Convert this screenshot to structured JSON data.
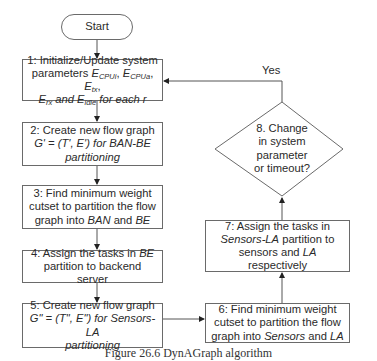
{
  "diagram": {
    "type": "flowchart",
    "start": {
      "label": "Start"
    },
    "steps": [
      {
        "id": 1,
        "lines": [
          {
            "prefix": "1: Initialize/Update system"
          },
          {
            "prefix": "parameters",
            "vars": [
              "E_CPUi",
              "E_CPUa",
              "E_tx"
            ]
          },
          {
            "vars2": [
              "E_rx",
              "E_idle"
            ],
            "suffix": "for each r"
          }
        ],
        "text": "1: Initialize/Update system parameters E_CPUi, E_CPUa, E_tx, E_rx and E_idle for each r"
      },
      {
        "id": 2,
        "text": "2: Create new flow graph G' = (T', E') for BAN-BE partitioning"
      },
      {
        "id": 3,
        "text": "3: Find minimum weight cutset to partition the flow graph into BAN and BE"
      },
      {
        "id": 4,
        "text": "4: Assign the tasks in BE partition to backend server"
      },
      {
        "id": 5,
        "text": "5: Create new flow graph G\" = (T\", E\") for Sensors-LA partitioning"
      },
      {
        "id": 6,
        "text": "6: Find minimum weight cutset to partition the flow graph into Sensors and LA"
      },
      {
        "id": 7,
        "text": "7: Assign the tasks in Sensors-LA partition to sensors and LA respectively"
      }
    ],
    "decision": {
      "id": 8,
      "text": "8. Change in system parameter or timeout?",
      "yes_label": "Yes"
    },
    "edges": [
      [
        "start",
        1
      ],
      [
        1,
        2
      ],
      [
        2,
        3
      ],
      [
        3,
        4
      ],
      [
        4,
        5
      ],
      [
        5,
        6
      ],
      [
        6,
        7
      ],
      [
        7,
        8
      ],
      [
        8,
        1,
        "Yes"
      ]
    ]
  },
  "labels": {
    "start": "Start",
    "s1_l1": "1: Initialize/Update system",
    "s1_params": "parameters",
    "E": "E",
    "sub_cpui": "CPUi",
    "sub_cpua": "CPUa",
    "sub_tx": "tx",
    "sub_rx": "rx",
    "sub_idle": "idle",
    "and": "and",
    "for_each_r": "for each r",
    "s2_l1": "2: Create new flow graph",
    "s2_l2": "G' = (T', E') for BAN-BE",
    "s2_l3": "partitioning",
    "s3_l1": "3: Find minimum weight",
    "s3_l2": "cutset to partition the flow",
    "s3_l3a": "graph into",
    "s3_ban": "BAN",
    "s3_and": "and",
    "s3_be": "BE",
    "s4_l1a": "4: Assign the tasks in",
    "s4_be": "BE",
    "s4_l2": "partition to backend server",
    "s5_l1": "5: Create new flow graph",
    "s5_l2": "G\" = (T\", E\") for Sensors-LA",
    "s5_l3": "partitioning",
    "s6_l1": "6: Find minimum weight",
    "s6_l2": "cutset to partition the flow",
    "s6_l3a": "graph into",
    "s6_sensors": "Sensors",
    "s6_and": "and",
    "s6_la": "LA",
    "s7_l1": "7: Assign the tasks in",
    "s7_sla": "Sensors-LA",
    "s7_l2b": "partition to",
    "s7_l3a": "sensors and",
    "s7_la": "LA",
    "s7_l3b": "respectively",
    "d8_l1": "8. Change",
    "d8_l2": "in system",
    "d8_l3": "parameter",
    "d8_l4": "or timeout?",
    "yes": "Yes",
    "caption": "Figure 26.6    DynAGraph algorithm"
  },
  "colors": {
    "stroke": "#6a6a6a",
    "text": "#2a2a2a",
    "background": "#ffffff"
  }
}
